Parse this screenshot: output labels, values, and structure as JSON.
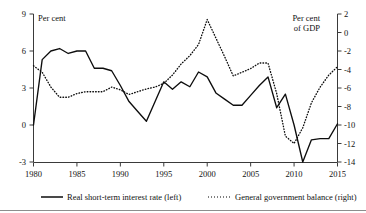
{
  "chart_data": {
    "type": "line",
    "title": "",
    "xlabel": "",
    "ylabel_left": "Per cent",
    "ylabel_right": "Per cent of GDP",
    "grid": false,
    "legend_position": "bottom",
    "xlim": [
      1980,
      2015
    ],
    "xticks": [
      1980,
      1985,
      1990,
      1995,
      2000,
      2005,
      2010,
      2015
    ],
    "xticklabels": [
      "1980",
      "1985",
      "1990",
      "1995",
      "2000",
      "2005",
      "2010",
      "2015"
    ],
    "ylim_left": [
      -3,
      9
    ],
    "yticks_left": [
      9,
      6,
      3,
      0,
      -3
    ],
    "yticklabels_left": [
      "9",
      "6",
      "3",
      "0",
      "-3"
    ],
    "ylim_right": [
      -14,
      2
    ],
    "yticks_right": [
      2,
      0,
      -2,
      -4,
      -6,
      -8,
      -10,
      -12,
      -14
    ],
    "yticklabels_right": [
      "2",
      "0",
      "-2",
      "-4",
      "-6",
      "-8",
      "-10",
      "-12",
      "-14"
    ],
    "x": [
      1980,
      1981,
      1982,
      1983,
      1984,
      1985,
      1986,
      1987,
      1988,
      1989,
      1990,
      1991,
      1992,
      1993,
      1994,
      1995,
      1996,
      1997,
      1998,
      1999,
      2000,
      2001,
      2002,
      2003,
      2004,
      2005,
      2006,
      2007,
      2008,
      2009,
      2010,
      2011,
      2012,
      2013,
      2014,
      2015
    ],
    "series": [
      {
        "name": "Real short-term interest rate (left)",
        "axis": "left",
        "style": "solid",
        "units": "Per cent",
        "values": [
          0.0,
          5.3,
          6.0,
          6.2,
          5.8,
          6.0,
          6.0,
          4.6,
          4.6,
          4.4,
          3.2,
          1.9,
          1.1,
          0.3,
          1.9,
          3.5,
          2.9,
          3.5,
          3.1,
          4.3,
          3.9,
          2.6,
          2.1,
          1.6,
          1.6,
          2.4,
          3.2,
          3.9,
          1.4,
          2.5,
          0.0,
          -3.0,
          -1.2,
          -1.1,
          -1.1,
          0.1
        ]
      },
      {
        "name": "General government balance (right)",
        "axis": "right",
        "style": "dotted",
        "units": "Per cent of GDP",
        "values": [
          -3.6,
          -4.3,
          -5.9,
          -7.0,
          -7.0,
          -6.6,
          -6.4,
          -6.4,
          -6.4,
          -5.9,
          -6.2,
          -6.7,
          -6.4,
          -6.1,
          -5.9,
          -5.5,
          -4.6,
          -3.4,
          -2.5,
          -1.3,
          1.4,
          -0.6,
          -2.6,
          -4.7,
          -4.3,
          -3.9,
          -3.3,
          -3.3,
          -6.6,
          -11.2,
          -12.0,
          -10.3,
          -7.6,
          -5.9,
          -4.6,
          -3.7
        ]
      }
    ],
    "legend": [
      {
        "label": "Real short-term interest rate (left)",
        "style": "solid"
      },
      {
        "label": "General government balance (right)",
        "style": "dotted"
      }
    ]
  }
}
